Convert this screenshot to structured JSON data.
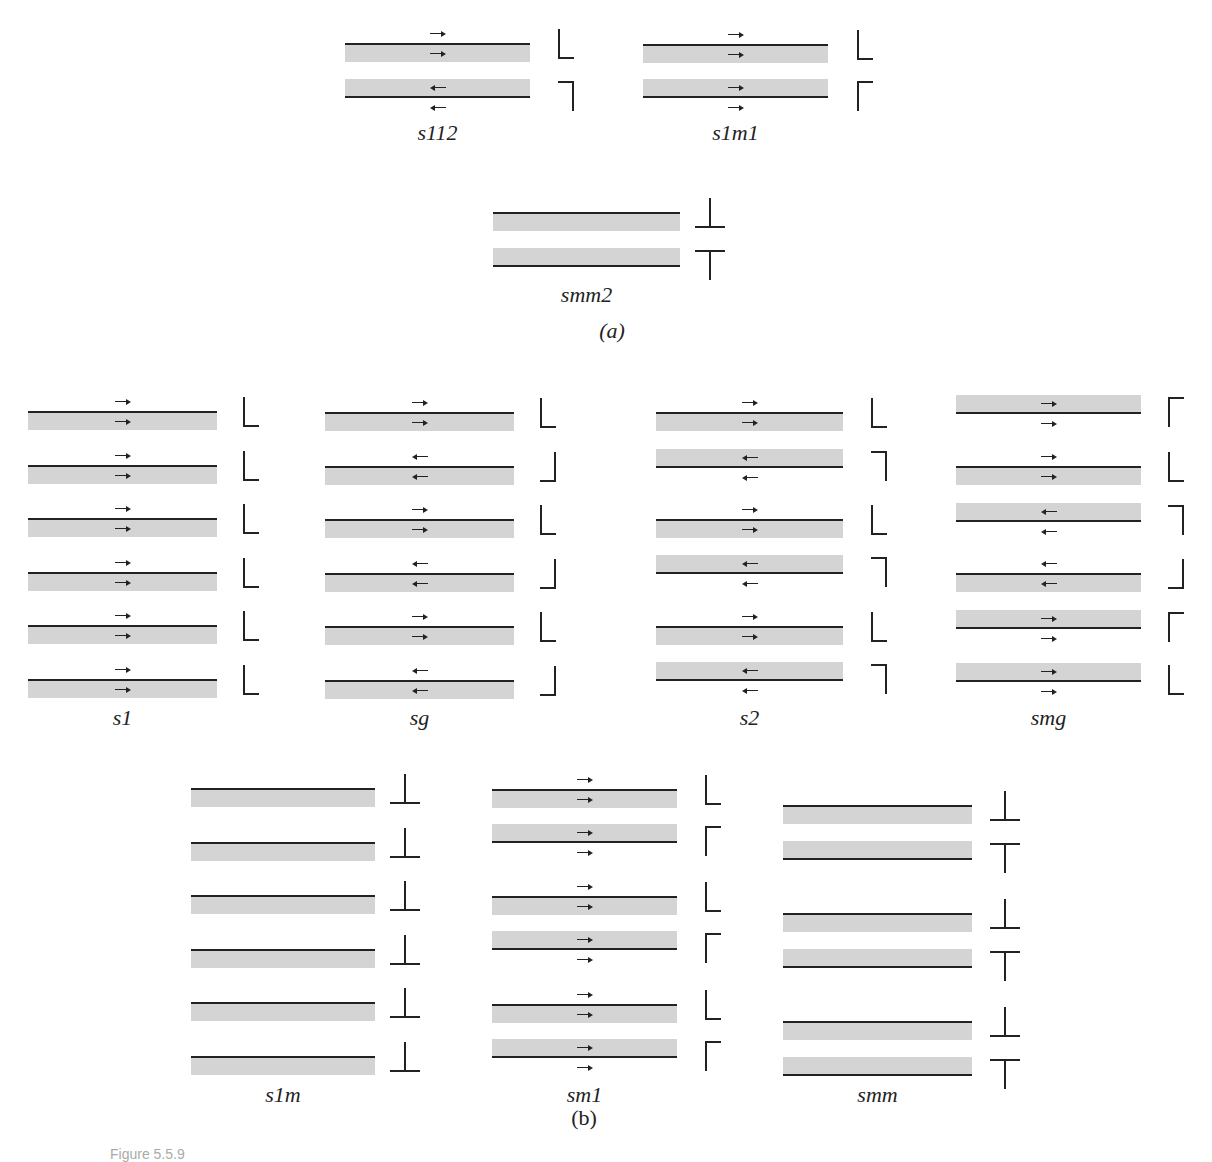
{
  "figure": {
    "caption": "Figure 5.5.9",
    "part_a_label": "(a)",
    "part_b_label": "(b)",
    "colors": {
      "layer_fill": "#d4d4d4",
      "line": "#222222",
      "background": "#ffffff"
    }
  },
  "groups": [
    {
      "id": "s112",
      "label": "s112",
      "x": 345,
      "w": 185,
      "gx": 558,
      "layers": [
        {
          "y": 43,
          "line": "top",
          "arrow_out": "right",
          "arrow_in": "right",
          "glyph": "L"
        },
        {
          "y": 79,
          "line": "bottom",
          "arrow_out": "left",
          "arrow_in": "left",
          "glyph": "backwards-L-top"
        }
      ],
      "label_y": 120
    },
    {
      "id": "s1m1",
      "label": "s1m1",
      "x": 643,
      "w": 185,
      "gx": 857,
      "layers": [
        {
          "y": 44,
          "line": "top",
          "arrow_out": "right",
          "arrow_in": "right",
          "glyph": "L"
        },
        {
          "y": 79,
          "line": "bottom",
          "arrow_out": "right",
          "arrow_in": "right",
          "glyph": "gamma"
        }
      ],
      "label_y": 120
    },
    {
      "id": "smm2",
      "label": "smm2",
      "x": 493,
      "w": 187,
      "gx": 703,
      "layers": [
        {
          "y": 212,
          "line": "top",
          "arrow_out": null,
          "arrow_in": null,
          "glyph": "inverted-T"
        },
        {
          "y": 248,
          "line": "bottom",
          "arrow_out": null,
          "arrow_in": null,
          "glyph": "T"
        }
      ],
      "label_y": 282
    },
    {
      "id": "s1",
      "label": "s1",
      "x": 28,
      "w": 189,
      "gx": 243,
      "layers": [
        {
          "y": 411,
          "line": "top",
          "arrow_out": "right",
          "arrow_in": "right",
          "glyph": "L"
        },
        {
          "y": 465,
          "line": "top",
          "arrow_out": "right",
          "arrow_in": "right",
          "glyph": "L"
        },
        {
          "y": 518,
          "line": "top",
          "arrow_out": "right",
          "arrow_in": "right",
          "glyph": "L"
        },
        {
          "y": 572,
          "line": "top",
          "arrow_out": "right",
          "arrow_in": "right",
          "glyph": "L"
        },
        {
          "y": 625,
          "line": "top",
          "arrow_out": "right",
          "arrow_in": "right",
          "glyph": "L"
        },
        {
          "y": 679,
          "line": "top",
          "arrow_out": "right",
          "arrow_in": "right",
          "glyph": "L"
        }
      ],
      "label_y": 705
    },
    {
      "id": "sg",
      "label": "sg",
      "x": 325,
      "w": 189,
      "gx": 540,
      "layers": [
        {
          "y": 412,
          "line": "top",
          "arrow_out": "right",
          "arrow_in": "right",
          "glyph": "L"
        },
        {
          "y": 466,
          "line": "top",
          "arrow_out": "left",
          "arrow_in": "left",
          "glyph": "backwards-L"
        },
        {
          "y": 519,
          "line": "top",
          "arrow_out": "right",
          "arrow_in": "right",
          "glyph": "L"
        },
        {
          "y": 573,
          "line": "top",
          "arrow_out": "left",
          "arrow_in": "left",
          "glyph": "backwards-L"
        },
        {
          "y": 626,
          "line": "top",
          "arrow_out": "right",
          "arrow_in": "right",
          "glyph": "L"
        },
        {
          "y": 680,
          "line": "top",
          "arrow_out": "left",
          "arrow_in": "left",
          "glyph": "backwards-L"
        }
      ],
      "label_y": 705
    },
    {
      "id": "s2",
      "label": "s2",
      "x": 656,
      "w": 187,
      "gx": 871,
      "layers": [
        {
          "y": 412,
          "line": "top",
          "arrow_out": "right",
          "arrow_in": "right",
          "glyph": "L"
        },
        {
          "y": 449,
          "line": "bottom",
          "arrow_out": "left",
          "arrow_in": "left",
          "glyph": "backwards-L-top"
        },
        {
          "y": 519,
          "line": "top",
          "arrow_out": "right",
          "arrow_in": "right",
          "glyph": "L"
        },
        {
          "y": 555,
          "line": "bottom",
          "arrow_out": "left",
          "arrow_in": "left",
          "glyph": "backwards-L-top"
        },
        {
          "y": 626,
          "line": "top",
          "arrow_out": "right",
          "arrow_in": "right",
          "glyph": "L"
        },
        {
          "y": 662,
          "line": "bottom",
          "arrow_out": "left",
          "arrow_in": "left",
          "glyph": "backwards-L-top"
        }
      ],
      "label_y": 705
    },
    {
      "id": "smg",
      "label": "smg",
      "x": 956,
      "w": 185,
      "gx": 1168,
      "layers": [
        {
          "y": 395,
          "line": "bottom",
          "arrow_out": "right",
          "arrow_in": "right",
          "glyph": "gamma"
        },
        {
          "y": 466,
          "line": "top",
          "arrow_out": "right",
          "arrow_in": "right",
          "glyph": "L"
        },
        {
          "y": 503,
          "line": "bottom",
          "arrow_out": "left",
          "arrow_in": "left",
          "glyph": "backwards-L-top"
        },
        {
          "y": 573,
          "line": "top",
          "arrow_out": "left",
          "arrow_in": "left",
          "glyph": "backwards-L"
        },
        {
          "y": 610,
          "line": "bottom",
          "arrow_out": "right",
          "arrow_in": "right",
          "glyph": "gamma"
        },
        {
          "y": 663,
          "line": "bottom",
          "arrow_out": "right",
          "arrow_in": "right",
          "glyph": "L"
        }
      ],
      "label_y": 705
    },
    {
      "id": "s1m",
      "label": "s1m",
      "x": 191,
      "w": 184,
      "gx": 398,
      "layers": [
        {
          "y": 788,
          "line": "top",
          "arrow_out": null,
          "arrow_in": null,
          "glyph": "inverted-T"
        },
        {
          "y": 842,
          "line": "top",
          "arrow_out": null,
          "arrow_in": null,
          "glyph": "inverted-T"
        },
        {
          "y": 895,
          "line": "top",
          "arrow_out": null,
          "arrow_in": null,
          "glyph": "inverted-T"
        },
        {
          "y": 949,
          "line": "top",
          "arrow_out": null,
          "arrow_in": null,
          "glyph": "inverted-T"
        },
        {
          "y": 1002,
          "line": "top",
          "arrow_out": null,
          "arrow_in": null,
          "glyph": "inverted-T"
        },
        {
          "y": 1056,
          "line": "top",
          "arrow_out": null,
          "arrow_in": null,
          "glyph": "inverted-T"
        }
      ],
      "label_y": 1082
    },
    {
      "id": "sm1",
      "label": "sm1",
      "x": 492,
      "w": 185,
      "gx": 705,
      "layers": [
        {
          "y": 789,
          "line": "top",
          "arrow_out": "right",
          "arrow_in": "right",
          "glyph": "L"
        },
        {
          "y": 824,
          "line": "bottom",
          "arrow_out": "right",
          "arrow_in": "right",
          "glyph": "gamma"
        },
        {
          "y": 896,
          "line": "top",
          "arrow_out": "right",
          "arrow_in": "right",
          "glyph": "L"
        },
        {
          "y": 931,
          "line": "bottom",
          "arrow_out": "right",
          "arrow_in": "right",
          "glyph": "gamma"
        },
        {
          "y": 1004,
          "line": "top",
          "arrow_out": "right",
          "arrow_in": "right",
          "glyph": "L"
        },
        {
          "y": 1039,
          "line": "bottom",
          "arrow_out": "right",
          "arrow_in": "right",
          "glyph": "gamma"
        }
      ],
      "label_y": 1082
    },
    {
      "id": "smm",
      "label": "smm",
      "x": 783,
      "w": 189,
      "gx": 998,
      "layers": [
        {
          "y": 805,
          "line": "top",
          "arrow_out": null,
          "arrow_in": null,
          "glyph": "inverted-T"
        },
        {
          "y": 841,
          "line": "bottom",
          "arrow_out": null,
          "arrow_in": null,
          "glyph": "T"
        },
        {
          "y": 913,
          "line": "top",
          "arrow_out": null,
          "arrow_in": null,
          "glyph": "inverted-T"
        },
        {
          "y": 949,
          "line": "bottom",
          "arrow_out": null,
          "arrow_in": null,
          "glyph": "T"
        },
        {
          "y": 1021,
          "line": "top",
          "arrow_out": null,
          "arrow_in": null,
          "glyph": "inverted-T"
        },
        {
          "y": 1057,
          "line": "bottom",
          "arrow_out": null,
          "arrow_in": null,
          "glyph": "T"
        }
      ],
      "label_y": 1082
    }
  ]
}
